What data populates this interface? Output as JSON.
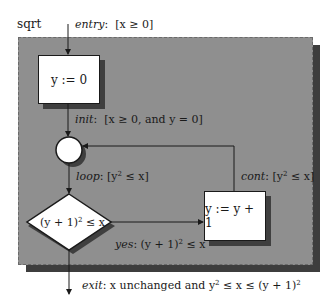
{
  "diagram": {
    "title": "sqrt",
    "entry": {
      "keyword": "entry",
      "condition": "[x ≥ 0]"
    },
    "nodes": {
      "init_box": {
        "label": "y := 0"
      },
      "junction": {
        "shape": "circle"
      },
      "decision": {
        "label_base": "(y + 1)",
        "label_exp": "2",
        "label_rest": " ≤ x"
      },
      "increment_box": {
        "label": "y := y + 1"
      }
    },
    "edges": {
      "init": {
        "keyword": "init",
        "condition": "[x ≥ 0, and y = 0]"
      },
      "loop": {
        "keyword": "loop",
        "cond_pre": "[y",
        "cond_exp": "2",
        "cond_post": " ≤ x]"
      },
      "yes": {
        "keyword": "yes",
        "cond_pre": "(y + 1)",
        "cond_exp": "2",
        "cond_post": " ≤ x"
      },
      "cont": {
        "keyword": "cont",
        "cond_pre": "[y",
        "cond_exp": "2",
        "cond_post": " ≤ x]"
      },
      "exit": {
        "keyword": "exit",
        "text_pre": "x unchanged and y",
        "exp1": "2",
        "text_mid": " ≤ x ≤ (y + 1)",
        "exp2": "2"
      }
    },
    "colors": {
      "panel": "#8f8f8f",
      "shadow": "#3d3d3d",
      "node_fill": "#ffffff",
      "stroke": "#1a1a1a"
    }
  }
}
